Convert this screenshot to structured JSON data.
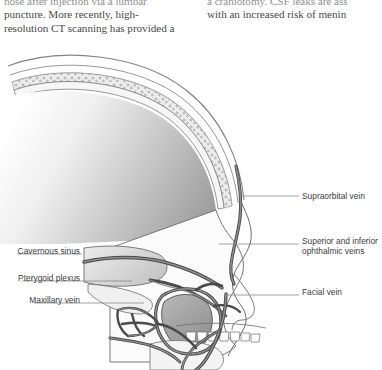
{
  "page": {
    "background": "#ffffff",
    "text_color": "#4a4a4a",
    "label_color": "#3d3d3d"
  },
  "body_text": {
    "left_column": {
      "lines": [
        "nose after injection via a lumbar",
        "puncture. More recently, high-",
        "resolution CT scanning has provided a"
      ]
    },
    "right_column": {
      "lines": [
        "a craniotomy. CSF leaks are ass",
        "with an increased risk of menin"
      ]
    }
  },
  "figure": {
    "name": "sagittal-head-venous-drainage",
    "colors": {
      "vein_stroke": "#4a4a4a",
      "vein_fill": "#8d8d8d",
      "bone_fill": "#f2f2f2",
      "bone_stroke": "#6b6b6b",
      "brain_gradient_start": "#ffffff",
      "brain_gradient_end": "#9d9d9d",
      "sinus_fill": "#d8d8d8",
      "leader_line": "#8a8a8a"
    },
    "labels_right": [
      {
        "id": "supraorbital",
        "text": "Supraorbital vein"
      },
      {
        "id": "ophthalmic",
        "line1": "Superior and inferior",
        "line2": "ophthalmic veins"
      },
      {
        "id": "facial",
        "text": "Facial vein"
      }
    ],
    "labels_left": [
      {
        "id": "cavernous",
        "text": "Cavernous sinus"
      },
      {
        "id": "pterygoid",
        "text": "Pterygoid plexus"
      },
      {
        "id": "maxillary",
        "text": "Maxillary vein"
      }
    ]
  }
}
